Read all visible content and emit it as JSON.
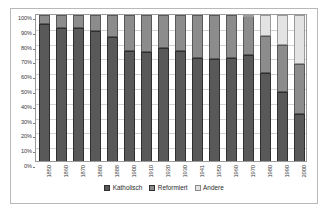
{
  "chart_data": {
    "type": "bar",
    "stacked": true,
    "normalized": "100%",
    "title": "",
    "subtitle": "",
    "xlabel": "",
    "ylabel": "",
    "ylim": [
      0,
      100
    ],
    "ytick_labels": [
      "100%",
      "90%",
      "80%",
      "70%",
      "60%",
      "50%",
      "40%",
      "30%",
      "20%",
      "10%",
      "0%"
    ],
    "ytick_values": [
      100,
      90,
      80,
      70,
      60,
      50,
      40,
      30,
      20,
      10,
      0
    ],
    "grid": true,
    "legend_position": "bottom",
    "categories": [
      "1850",
      "1860",
      "1870",
      "1880",
      "1888",
      "1900",
      "1910",
      "1920",
      "1930",
      "1941",
      "1950",
      "1960",
      "1970",
      "1980",
      "1990",
      "2000"
    ],
    "series": [
      {
        "name": "Katholisch",
        "color": "#595959",
        "values": [
          94,
          91,
          91,
          89,
          85,
          76,
          75,
          78,
          76,
          71,
          70,
          71,
          73,
          61,
          48,
          33
        ]
      },
      {
        "name": "Reformiert",
        "color": "#8c8c8c",
        "values": [
          6,
          9,
          9,
          11,
          15,
          24,
          25,
          22,
          24,
          29,
          30,
          29,
          26,
          25,
          32,
          34
        ]
      },
      {
        "name": "Andere",
        "color": "#e3e3e3",
        "values": [
          0,
          0,
          0,
          0,
          0,
          0,
          0,
          0,
          0,
          0,
          0,
          0,
          1,
          14,
          20,
          33
        ]
      }
    ]
  },
  "legend": {
    "items": [
      {
        "label": "Katholisch",
        "color": "#595959"
      },
      {
        "label": "Reformiert",
        "color": "#8c8c8c"
      },
      {
        "label": "Andere",
        "color": "#e3e3e3"
      }
    ]
  }
}
